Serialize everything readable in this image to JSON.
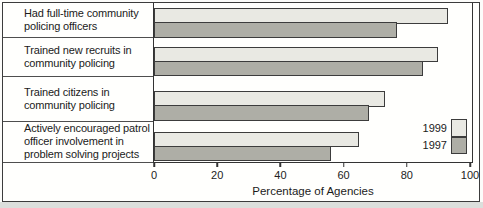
{
  "chart_data": {
    "type": "bar",
    "orientation": "horizontal",
    "categories": [
      "Had full-time community\npolicing officers",
      "Trained new recruits in\ncommunity policing",
      "Trained citizens in\ncommunity policing",
      "Actively encouraged patrol\nofficer involvement in\nproblem solving projects"
    ],
    "series": [
      {
        "name": "1999",
        "values": [
          93,
          90,
          73,
          65
        ],
        "color": "#e9e9e3"
      },
      {
        "name": "1997",
        "values": [
          77,
          85,
          68,
          56
        ],
        "color": "#aeaea6"
      }
    ],
    "xlabel": "Percentage of Agencies",
    "xticks": [
      0,
      20,
      40,
      60,
      80,
      100
    ],
    "xlim": [
      0,
      100
    ],
    "grid": false,
    "legend_position": "bottom-right",
    "bar_border_color": "#3c3c3c"
  }
}
